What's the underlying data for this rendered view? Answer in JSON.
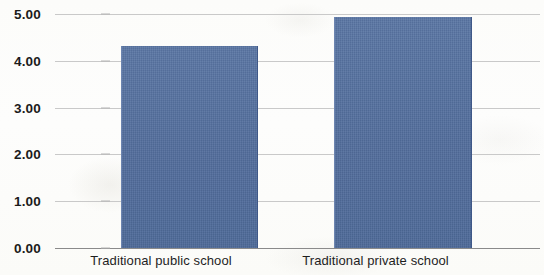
{
  "chart_data": {
    "type": "bar",
    "title": "",
    "xlabel": "",
    "ylabel": "",
    "categories": [
      "Traditional public school",
      "Traditional private school"
    ],
    "values": [
      4.32,
      4.93
    ],
    "ylim": [
      0,
      5
    ],
    "ytick_step": 1,
    "ytick_labels": [
      "0.00",
      "1.00",
      "2.00",
      "3.00",
      "4.00",
      "5.00"
    ],
    "ytick_values": [
      0,
      1,
      2,
      3,
      4,
      5
    ],
    "grid": true,
    "legend": false,
    "series": [
      {
        "name": "",
        "values": [
          4.32,
          4.93
        ]
      }
    ],
    "colors": {
      "bar_fill": "#54709f",
      "gridline": "#c9c9c9",
      "axis_line": "#8a8a8a",
      "label_text": "#1b1b1b",
      "background": "#fdfdfb"
    }
  }
}
